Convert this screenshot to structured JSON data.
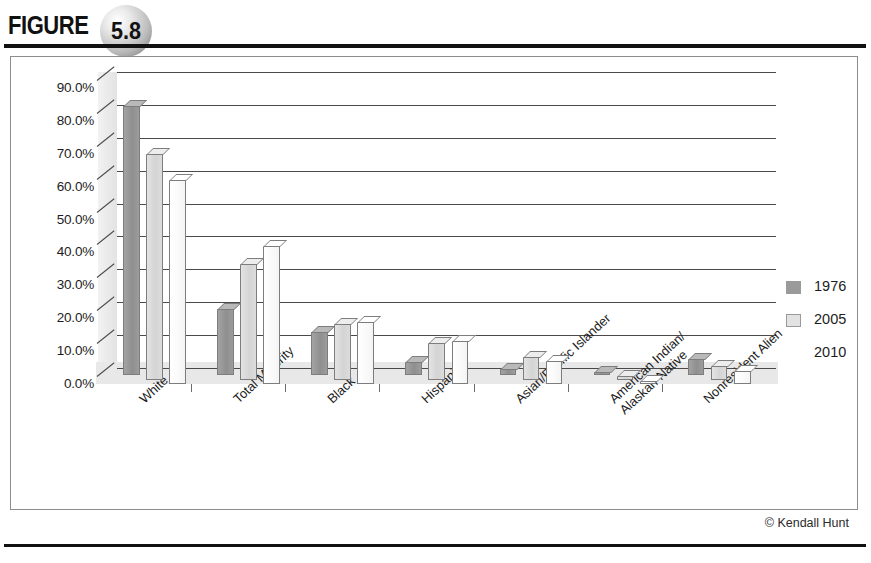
{
  "figure": {
    "label": "FIGURE",
    "number": "5.8"
  },
  "credit": "© Kendall Hunt",
  "chart_data": {
    "type": "bar",
    "title": "",
    "subtitle": "",
    "xlabel": "",
    "ylabel": "",
    "ylim": [
      0,
      90
    ],
    "ytick_labels": [
      "0.0%",
      "10.0%",
      "20.0%",
      "30.0%",
      "40.0%",
      "50.0%",
      "60.0%",
      "70.0%",
      "80.0%",
      "90.0%"
    ],
    "ytick_values": [
      0,
      10,
      20,
      30,
      40,
      50,
      60,
      70,
      80,
      90
    ],
    "grid": true,
    "three_d": true,
    "legend_position": "right",
    "categories": [
      "White",
      "Total Minority",
      "Black",
      "Hispanic",
      "Asian/Pacific Islander",
      "American Indian/\nAlaskan Native",
      "Nonresident Alien"
    ],
    "series": [
      {
        "name": "1976",
        "color": "#9a9a9a",
        "values": [
          82.0,
          20.0,
          13.0,
          4.0,
          2.0,
          1.0,
          5.0
        ]
      },
      {
        "name": "2005",
        "color": "#e2e2e2",
        "values": [
          68.5,
          35.0,
          17.0,
          11.0,
          7.0,
          1.0,
          4.0
        ]
      },
      {
        "name": "2010",
        "color": "#ffffff",
        "values": [
          62.0,
          42.0,
          19.0,
          13.0,
          7.0,
          1.0,
          4.0
        ]
      }
    ]
  }
}
